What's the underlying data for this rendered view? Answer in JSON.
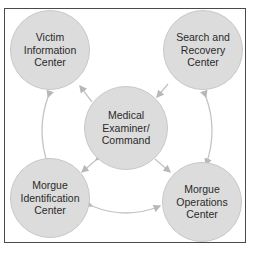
{
  "diagram": {
    "nodes": [
      {
        "id": "victim",
        "label": "Victim\nInformation\nCenter"
      },
      {
        "id": "search",
        "label": "Search and\nRecovery\nCenter"
      },
      {
        "id": "medical",
        "label": "Medical\nExaminer/\nCommand"
      },
      {
        "id": "morgue_id",
        "label": "Morgue\nIdentification\nCenter"
      },
      {
        "id": "morgue_ops",
        "label": "Morgue\nOperations\nCenter"
      }
    ],
    "edges": [
      {
        "from": "medical",
        "to": "victim",
        "type": "arrow"
      },
      {
        "from": "search",
        "to": "medical",
        "type": "arrow"
      },
      {
        "from": "medical",
        "to": "morgue_id",
        "type": "bidirectional"
      },
      {
        "from": "medical",
        "to": "morgue_ops",
        "type": "arrow"
      },
      {
        "from": "victim",
        "to": "morgue_id",
        "type": "bidirectional"
      },
      {
        "from": "morgue_ops",
        "to": "search",
        "type": "bidirectional"
      },
      {
        "from": "morgue_id",
        "to": "morgue_ops",
        "type": "bidirectional"
      }
    ],
    "colors": {
      "node_fill": "#dcdcdc",
      "arrow": "#b8b8b8",
      "border": "#4a4a4a"
    }
  }
}
